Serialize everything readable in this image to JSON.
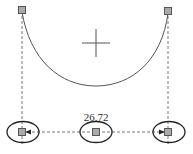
{
  "diagram": {
    "type": "sketch-dimension",
    "colors": {
      "line": "#555555",
      "handle_fill": "#aaaaaa",
      "handle_stroke": "#555555",
      "background": "#ffffff"
    },
    "arc": {
      "start": [
        22,
        10
      ],
      "end": [
        168,
        11
      ],
      "bottom_y": 86
    },
    "center_mark": {
      "x": 96,
      "y": 43,
      "half_size": 14
    },
    "dimension": {
      "label": "26.72",
      "y": 132
    },
    "handles": {
      "left": {
        "x": 22,
        "y": 132
      },
      "middle": {
        "x": 96,
        "y": 132
      },
      "right": {
        "x": 168,
        "y": 132
      }
    }
  }
}
